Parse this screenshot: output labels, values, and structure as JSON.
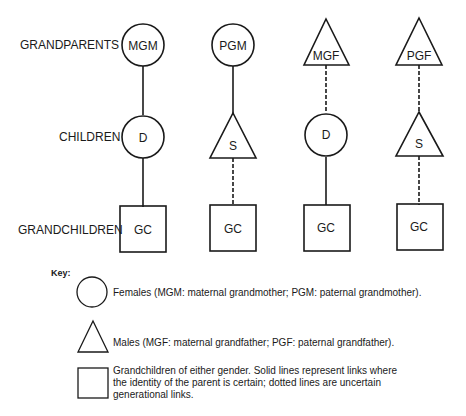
{
  "row_labels": {
    "grandparents": "GRANDPARENTS",
    "children": "CHILDREN",
    "grandchildren": "GRANDCHILDREN"
  },
  "columns": [
    {
      "grandparent": {
        "label": "MGM",
        "shape": "circle"
      },
      "child": {
        "label": "D",
        "shape": "circle"
      },
      "grandchild": {
        "label": "GC",
        "shape": "square"
      },
      "link_gp_child": "solid",
      "link_child_gc": "solid"
    },
    {
      "grandparent": {
        "label": "PGM",
        "shape": "circle"
      },
      "child": {
        "label": "S",
        "shape": "triangle"
      },
      "grandchild": {
        "label": "GC",
        "shape": "square"
      },
      "link_gp_child": "solid",
      "link_child_gc": "dotted"
    },
    {
      "grandparent": {
        "label": "MGF",
        "shape": "triangle"
      },
      "child": {
        "label": "D",
        "shape": "circle"
      },
      "grandchild": {
        "label": "GC",
        "shape": "square"
      },
      "link_gp_child": "dotted",
      "link_child_gc": "solid"
    },
    {
      "grandparent": {
        "label": "PGF",
        "shape": "triangle"
      },
      "child": {
        "label": "S",
        "shape": "triangle"
      },
      "grandchild": {
        "label": "GC",
        "shape": "square"
      },
      "link_gp_child": "dotted",
      "link_child_gc": "dotted"
    }
  ],
  "key": {
    "title": "Key:",
    "items": [
      {
        "shape": "circle",
        "text": "Females (MGM: maternal grandmother; PGM: paternal grandmother)."
      },
      {
        "shape": "triangle",
        "text": "Males (MGF: maternal grandfather; PGF: paternal grandfather)."
      },
      {
        "shape": "square",
        "text_lines": [
          "Grandchildren of either gender. Solid lines represent links where",
          "the identity of the parent is certain; dotted lines are uncertain",
          "generational links."
        ]
      }
    ]
  }
}
